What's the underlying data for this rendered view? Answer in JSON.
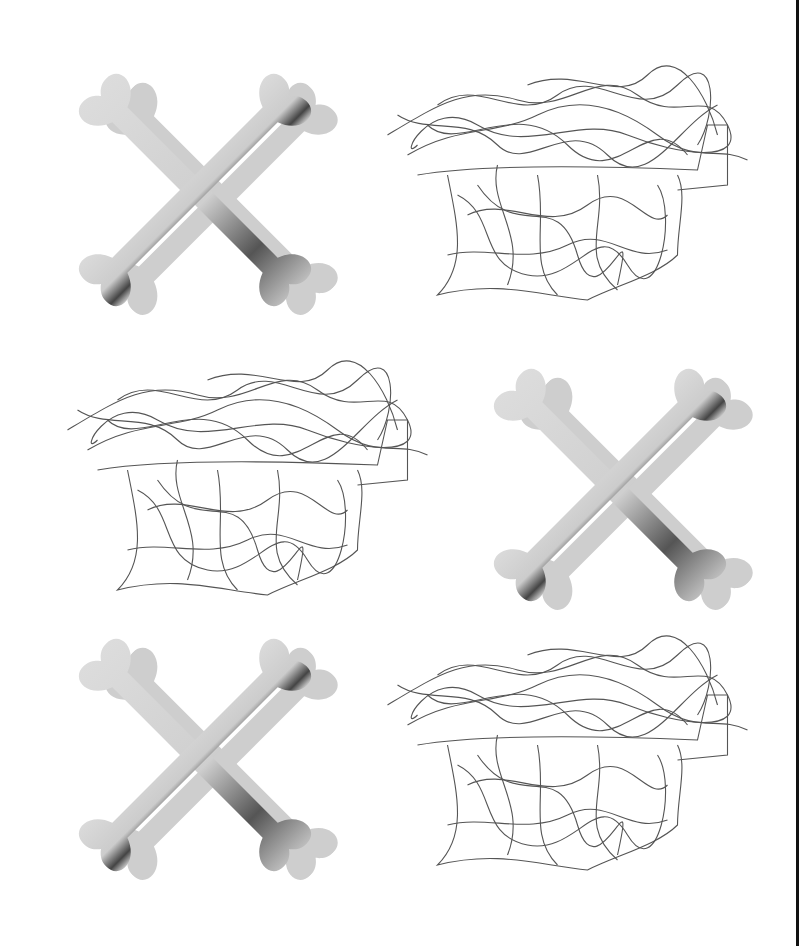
{
  "image": {
    "description": "Grid of six rendered objects: crossed bones and tangled wire chairs, alternating",
    "background": "#ffffff",
    "border_color": "#111111",
    "tiles": [
      {
        "kind": "crossed-bones",
        "position": "row1-left"
      },
      {
        "kind": "wire-chair",
        "position": "row1-right"
      },
      {
        "kind": "wire-chair",
        "position": "row2-left"
      },
      {
        "kind": "crossed-bones",
        "position": "row2-right"
      },
      {
        "kind": "crossed-bones",
        "position": "row3-left"
      },
      {
        "kind": "wire-chair",
        "position": "row3-right"
      }
    ],
    "colors": {
      "bone_light": "#d4d4d4",
      "bone_shadow": "#2e2e2e",
      "bone_drop_shadow": "#c4c4c4",
      "wire": "#555555"
    }
  }
}
